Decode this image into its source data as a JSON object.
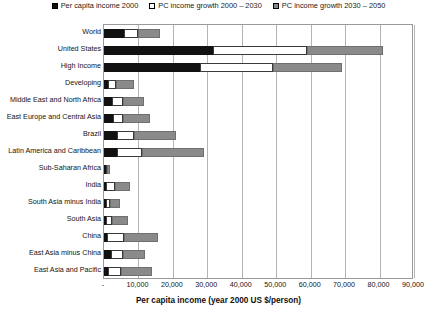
{
  "chart_data": {
    "type": "bar",
    "orientation": "horizontal",
    "stacked": true,
    "title": "",
    "xlabel": "Per capita income (year 2000 US $/person)",
    "ylabel": "",
    "xlim": [
      0,
      90000
    ],
    "xticks": [
      "-",
      "10,000",
      "20,000",
      "30,000",
      "40,000",
      "50,000",
      "60,000",
      "70,000",
      "80,000",
      "90,000"
    ],
    "xtick_values": [
      0,
      10000,
      20000,
      30000,
      40000,
      50000,
      60000,
      70000,
      80000,
      90000
    ],
    "grid": true,
    "legend_position": "top",
    "categories": [
      "World",
      "United States",
      "High Income",
      "Developing",
      "Middle East and North Africa",
      "East Europe and Central Asia",
      "Brazil",
      "Latin America and Caribbean",
      "Sub-Saharan Africa",
      "India",
      "South Asia minus India",
      "South Asia",
      "China",
      "East Asia  minus China",
      "East Asia and Pacific"
    ],
    "series": [
      {
        "name": "Per capita income 2000",
        "color": "#111111",
        "values": [
          5800,
          31500,
          28000,
          1200,
          2200,
          2500,
          3700,
          3900,
          600,
          500,
          500,
          500,
          1000,
          2100,
          1300
        ]
      },
      {
        "name": "PC income growth 2000 - 2030",
        "color": "#ffffff",
        "values": [
          4200,
          27500,
          21000,
          2300,
          3300,
          3000,
          5000,
          7000,
          400,
          2600,
          1200,
          1900,
          4800,
          3300,
          3600
        ]
      },
      {
        "name": "PC income growth 2030 - 2050",
        "color": "#8a8a8a",
        "values": [
          6300,
          22000,
          20000,
          5200,
          6200,
          7800,
          12200,
          18000,
          700,
          4500,
          3000,
          4500,
          10000,
          6500,
          9000
        ]
      }
    ]
  },
  "legend": {
    "items": [
      {
        "label": "Per capita income 2000",
        "swatch": "black"
      },
      {
        "label": "PC income growth 2000 – 2030",
        "swatch": "white"
      },
      {
        "label": "PC income growth 2030 – 2050",
        "swatch": "gray"
      }
    ]
  },
  "axis": {
    "x_title": "Per capita income (year 2000 US $/person)"
  }
}
